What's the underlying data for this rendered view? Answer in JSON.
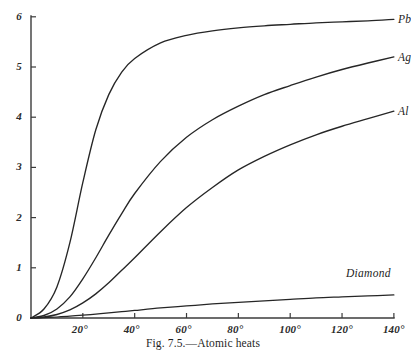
{
  "figure": {
    "caption": "Fig. 7.5.—Atomic heats",
    "background_color": "#ffffff",
    "axis_color": "#3b3b3b",
    "curve_color": "#262626"
  },
  "chart_data": {
    "type": "line",
    "title": "Fig. 7.5.—Atomic heats",
    "xlabel": "",
    "ylabel": "",
    "xlim": [
      0,
      145
    ],
    "ylim": [
      0,
      6
    ],
    "grid": false,
    "legend": "inline-curve-end-labels",
    "x_tick_labels": [
      "20°",
      "40°",
      "60°",
      "80°",
      "100°",
      "120°",
      "140°"
    ],
    "x_tick_values": [
      20,
      40,
      60,
      80,
      100,
      120,
      140
    ],
    "y_tick_labels": [
      "0",
      "1",
      "2",
      "3",
      "4",
      "5",
      "6"
    ],
    "y_tick_values": [
      0,
      1,
      2,
      3,
      4,
      5,
      6
    ],
    "x": [
      0,
      5,
      10,
      15,
      20,
      25,
      30,
      35,
      40,
      50,
      60,
      70,
      80,
      90,
      100,
      110,
      120,
      130,
      140
    ],
    "series": [
      {
        "name": "Pb",
        "label": "Pb",
        "values": [
          0,
          0.18,
          0.62,
          1.5,
          2.7,
          3.75,
          4.45,
          4.9,
          5.17,
          5.48,
          5.63,
          5.72,
          5.78,
          5.82,
          5.85,
          5.88,
          5.9,
          5.92,
          5.95
        ]
      },
      {
        "name": "Ag",
        "label": "Ag",
        "values": [
          0,
          0.05,
          0.18,
          0.42,
          0.78,
          1.2,
          1.65,
          2.08,
          2.48,
          3.12,
          3.6,
          3.95,
          4.22,
          4.45,
          4.63,
          4.8,
          4.95,
          5.08,
          5.2
        ]
      },
      {
        "name": "Al",
        "label": "Al",
        "values": [
          0,
          0.02,
          0.07,
          0.16,
          0.3,
          0.48,
          0.7,
          0.95,
          1.2,
          1.72,
          2.2,
          2.6,
          2.95,
          3.22,
          3.45,
          3.65,
          3.82,
          3.97,
          4.12
        ]
      },
      {
        "name": "Diamond",
        "label": "Diamond",
        "values": [
          0,
          0.008,
          0.02,
          0.035,
          0.055,
          0.078,
          0.1,
          0.125,
          0.15,
          0.2,
          0.24,
          0.28,
          0.31,
          0.34,
          0.37,
          0.4,
          0.42,
          0.44,
          0.46
        ]
      }
    ]
  },
  "axes": {
    "y_ticks": [
      {
        "label": "6",
        "value": 6
      },
      {
        "label": "5",
        "value": 5
      },
      {
        "label": "4",
        "value": 4
      },
      {
        "label": "3",
        "value": 3
      },
      {
        "label": "2",
        "value": 2
      },
      {
        "label": "1",
        "value": 1
      },
      {
        "label": "0",
        "value": 0
      }
    ],
    "x_ticks": [
      {
        "label": "20°",
        "value": 20
      },
      {
        "label": "40°",
        "value": 40
      },
      {
        "label": "60°",
        "value": 60
      },
      {
        "label": "80°",
        "value": 80
      },
      {
        "label": "100°",
        "value": 100
      },
      {
        "label": "120°",
        "value": 120
      },
      {
        "label": "140°",
        "value": 140
      }
    ]
  },
  "curve_labels": [
    {
      "name": "Pb",
      "text": "Pb"
    },
    {
      "name": "Ag",
      "text": "Ag"
    },
    {
      "name": "Al",
      "text": "Al"
    },
    {
      "name": "Diamond",
      "text": "Diamond"
    }
  ]
}
